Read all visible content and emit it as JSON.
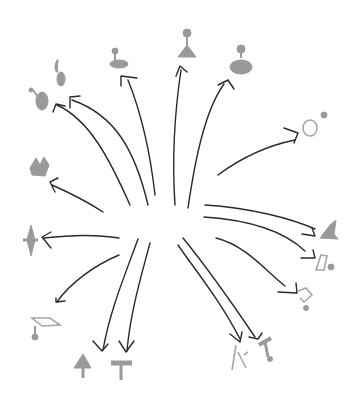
{
  "diagram": {
    "type": "radial-sketch",
    "center": [
      165,
      235
    ],
    "colors": {
      "arrow": "#2a2a2a",
      "icon": "#9a9a9a",
      "background": "#ffffff"
    },
    "targets": [
      {
        "id": "t1",
        "name": "saxophone-like-figure",
        "pos": [
          42,
          98
        ]
      },
      {
        "id": "t2",
        "name": "hook-figure",
        "pos": [
          60,
          75
        ]
      },
      {
        "id": "t3",
        "name": "disc-stand",
        "pos": [
          118,
          60
        ]
      },
      {
        "id": "t4",
        "name": "cone-lamp",
        "pos": [
          184,
          48
        ]
      },
      {
        "id": "t5",
        "name": "blob-knob",
        "pos": [
          241,
          63
        ]
      },
      {
        "id": "t6",
        "name": "ring-with-dot",
        "pos": [
          310,
          126
        ]
      },
      {
        "id": "t7",
        "name": "crown-scribble",
        "pos": [
          40,
          168
        ]
      },
      {
        "id": "t8",
        "name": "spindle",
        "pos": [
          31,
          240
        ]
      },
      {
        "id": "t9",
        "name": "graduation-cap",
        "pos": [
          42,
          327
        ]
      },
      {
        "id": "t10",
        "name": "mushroom-bell",
        "pos": [
          83,
          370
        ]
      },
      {
        "id": "t11",
        "name": "t-stool",
        "pos": [
          123,
          370
        ]
      },
      {
        "id": "t12",
        "name": "bird-figure",
        "pos": [
          330,
          233
        ]
      },
      {
        "id": "t13",
        "name": "outline-funnel",
        "pos": [
          326,
          265
        ]
      },
      {
        "id": "t14",
        "name": "outline-chair",
        "pos": [
          304,
          298
        ]
      },
      {
        "id": "t15",
        "name": "twig-figure",
        "pos": [
          240,
          360
        ]
      },
      {
        "id": "t16",
        "name": "t-figure",
        "pos": [
          267,
          350
        ]
      }
    ]
  }
}
